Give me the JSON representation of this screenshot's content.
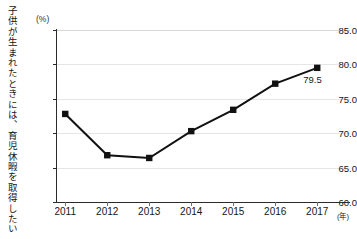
{
  "caption": {
    "vertical_title": "子供が生まれたときには、育児休暇を取得したい男性"
  },
  "axis": {
    "y_unit": "(%)",
    "x_unit": "(年)"
  },
  "chart_data": {
    "type": "line",
    "title": "子供が生まれたときには、育児休暇を取得したい男性",
    "xlabel": "(年)",
    "ylabel": "(%)",
    "categories": [
      "2011",
      "2012",
      "2013",
      "2014",
      "2015",
      "2016",
      "2017"
    ],
    "values": [
      72.8,
      66.8,
      66.4,
      70.3,
      73.4,
      77.2,
      79.5
    ],
    "ylim": [
      60.0,
      85.0
    ],
    "ytick_labels": [
      "85.0",
      "80.0",
      "75.0",
      "70.0",
      "65.0",
      "60.0"
    ],
    "ytick_values": [
      85.0,
      80.0,
      75.0,
      70.0,
      65.0,
      60.0
    ],
    "grid": true,
    "legend": "none",
    "marker": "square",
    "line_color": "#111111",
    "marker_color": "#111111",
    "grid_color": "#e6e6e6",
    "annotations": [
      {
        "label": "79.5",
        "category": "2017",
        "value": 79.5
      }
    ]
  }
}
